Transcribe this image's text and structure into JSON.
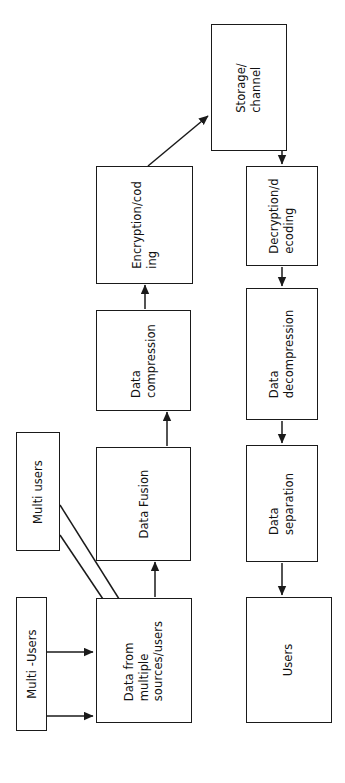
{
  "diagram": {
    "orientation": "rotated-90-ccw",
    "stroke_color": "#1a1a1a",
    "background_color": "#ffffff",
    "text_color": "#111111",
    "nodes": [
      {
        "id": "storage",
        "label": "Storage/\nchannel"
      },
      {
        "id": "encryption",
        "label": "Encryption/cod\ning"
      },
      {
        "id": "compression",
        "label": "Data\ncompression"
      },
      {
        "id": "fusion",
        "label": "Data Fusion"
      },
      {
        "id": "multi_users_top",
        "label": "Multi users"
      },
      {
        "id": "multi_users_low",
        "label": "Multi -Users"
      },
      {
        "id": "data_sources",
        "label": "Data from\nmultiple\nsources/users"
      },
      {
        "id": "decryption",
        "label": "Decryption/d\necoding"
      },
      {
        "id": "decompression",
        "label": "Data\ndecompression"
      },
      {
        "id": "separation",
        "label": "Data\nseparation"
      },
      {
        "id": "users",
        "label": "Users"
      }
    ],
    "edges": [
      {
        "from": "multi_users_top",
        "to": "data_sources",
        "style": "diagonal-arrow"
      },
      {
        "from": "multi_users_top",
        "to": "data_sources",
        "style": "diagonal-arrow"
      },
      {
        "from": "multi_users_low",
        "to": "data_sources",
        "style": "straight-arrow"
      },
      {
        "from": "multi_users_low",
        "to": "data_sources",
        "style": "straight-arrow"
      },
      {
        "from": "data_sources",
        "to": "fusion",
        "style": "straight-arrow"
      },
      {
        "from": "fusion",
        "to": "compression",
        "style": "straight-arrow"
      },
      {
        "from": "compression",
        "to": "encryption",
        "style": "straight-arrow"
      },
      {
        "from": "encryption",
        "to": "storage",
        "style": "diagonal-arrow"
      },
      {
        "from": "storage",
        "to": "decryption",
        "style": "straight-arrow"
      },
      {
        "from": "decryption",
        "to": "decompression",
        "style": "straight-arrow"
      },
      {
        "from": "decompression",
        "to": "separation",
        "style": "straight-arrow"
      },
      {
        "from": "separation",
        "to": "users",
        "style": "straight-arrow"
      }
    ]
  }
}
